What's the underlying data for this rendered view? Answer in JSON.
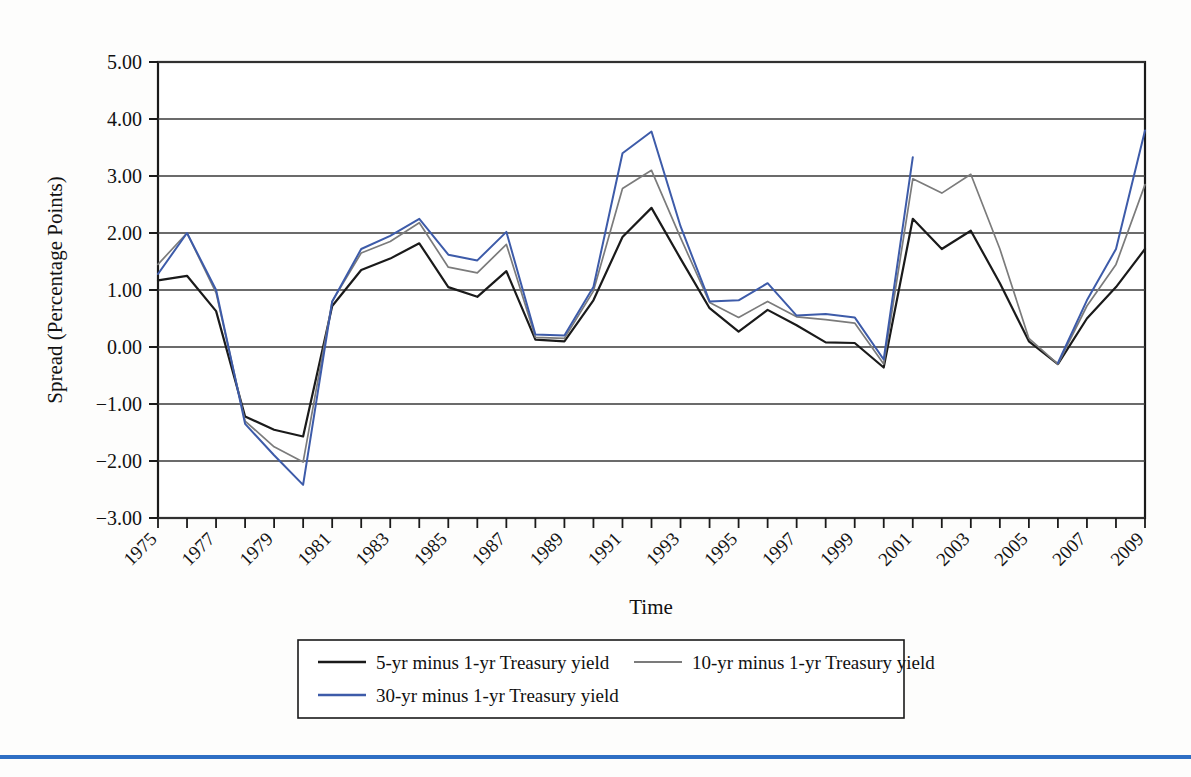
{
  "chart_data": {
    "type": "line",
    "title": "",
    "xlabel": "Time",
    "ylabel": "Spread (Percentage Points)",
    "ylim": [
      -3.0,
      5.0
    ],
    "xlim": [
      1975,
      2009
    ],
    "yticks": [
      "5.00",
      "4.00",
      "3.00",
      "2.00",
      "1.00",
      "0.00",
      "-1.00",
      "-2.00",
      "-3.00"
    ],
    "ytick_values": [
      5,
      4,
      3,
      2,
      1,
      0,
      -1,
      -2,
      -3
    ],
    "xticks_labeled": [
      "1975",
      "1977",
      "1979",
      "1981",
      "1983",
      "1985",
      "1987",
      "1989",
      "1991",
      "1993",
      "1995",
      "1997",
      "1999",
      "2001",
      "2003",
      "2005",
      "2007",
      "2009"
    ],
    "x": [
      1975,
      1976,
      1977,
      1978,
      1979,
      1980,
      1981,
      1982,
      1983,
      1984,
      1985,
      1986,
      1987,
      1988,
      1989,
      1990,
      1991,
      1992,
      1993,
      1994,
      1995,
      1996,
      1997,
      1998,
      1999,
      2000,
      2001,
      2002,
      2003,
      2004,
      2005,
      2006,
      2007,
      2008,
      2009
    ],
    "grid": true,
    "legend_position": "bottom",
    "series": [
      {
        "name": "5-yr minus 1-yr Treasury yield",
        "color": "#1a1a1a",
        "values": [
          1.17,
          1.25,
          0.63,
          -1.22,
          -1.45,
          -1.57,
          0.72,
          1.35,
          1.55,
          1.82,
          1.05,
          0.88,
          1.33,
          0.13,
          0.1,
          0.82,
          1.93,
          2.44,
          1.55,
          0.68,
          0.27,
          0.65,
          0.38,
          0.08,
          0.07,
          -0.36,
          2.25,
          1.72,
          2.04,
          1.12,
          0.1,
          -0.3,
          0.5,
          1.05,
          1.72
        ]
      },
      {
        "name": "10-yr minus 1-yr Treasury yield",
        "color": "#7b7b7b",
        "values": [
          1.45,
          2.0,
          0.95,
          -1.3,
          -1.75,
          -2.02,
          0.8,
          1.65,
          1.85,
          2.18,
          1.4,
          1.3,
          1.8,
          0.17,
          0.15,
          0.98,
          2.78,
          3.1,
          1.92,
          0.78,
          0.52,
          0.8,
          0.53,
          0.48,
          0.42,
          -0.3,
          2.95,
          2.7,
          3.03,
          1.72,
          0.15,
          -0.3,
          0.72,
          1.45,
          2.85
        ]
      },
      {
        "name": "30-yr minus 1-yr Treasury yield",
        "color": "#3d5ba9",
        "values": [
          1.28,
          2.0,
          1.0,
          -1.35,
          -1.9,
          -2.42,
          0.8,
          1.72,
          1.95,
          2.25,
          1.62,
          1.52,
          2.02,
          0.22,
          0.2,
          1.05,
          3.4,
          3.78,
          2.12,
          0.8,
          0.82,
          1.12,
          0.55,
          0.58,
          0.52,
          -0.22,
          3.33,
          null,
          null,
          null,
          null,
          -0.28,
          0.82,
          1.72,
          3.8
        ]
      }
    ]
  },
  "legend": {
    "items": [
      {
        "label": "5-yr minus 1-yr Treasury yield",
        "color": "#1a1a1a"
      },
      {
        "label": "10-yr minus 1-yr Treasury yield",
        "color": "#7b7b7b"
      },
      {
        "label": "30-yr minus 1-yr Treasury yield",
        "color": "#3d5ba9"
      }
    ]
  },
  "colors": {
    "accent_rule": "#2f6fc4",
    "axis": "#1a1a1a",
    "grid": "#3a3a3a",
    "background": "#fdfdfc"
  }
}
